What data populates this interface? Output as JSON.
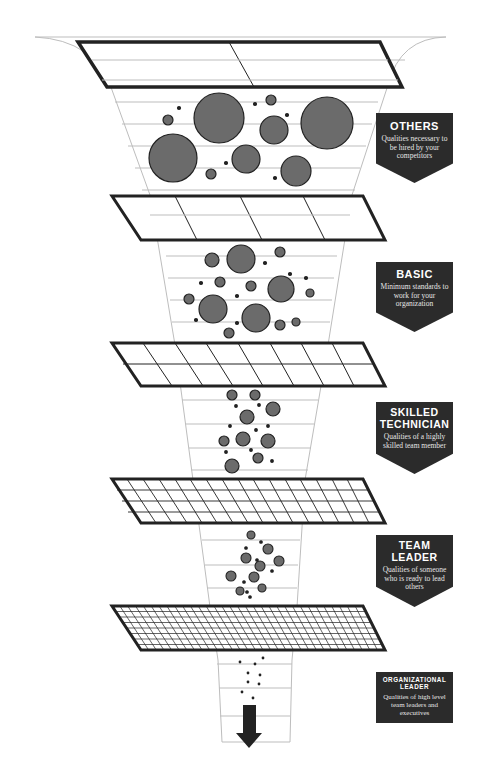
{
  "colors": {
    "box_fill": "#2b2b2b",
    "box_text": "#ffffff",
    "circle_fill": "#6b6b6b",
    "circle_stroke": "#222222",
    "screen_stroke": "#222222",
    "funnel_stroke": "#bdbdbd"
  },
  "levels": [
    {
      "title_lines": [
        "OTHERS"
      ],
      "description": "Qualities necessary to be hired by your competitors",
      "screen_cols": 2,
      "screen_rows": 1
    },
    {
      "title_lines": [
        "BASIC"
      ],
      "description": "Minimum standards to work for your organization",
      "screen_cols": 4,
      "screen_rows": 1
    },
    {
      "title_lines": [
        "SKILLED",
        "TECHNICIAN"
      ],
      "description": "Qualities of a highly skilled team member",
      "screen_cols": 8,
      "screen_rows": 2
    },
    {
      "title_lines": [
        "TEAM",
        "LEADER"
      ],
      "description": "Qualities of someone who is ready to lead others",
      "screen_cols": 16,
      "screen_rows": 4
    },
    {
      "title_lines": [
        "ORGANIZATIONAL",
        "LEADER"
      ],
      "description": "Qualities of high level team leaders and executives",
      "screen_cols": 32,
      "screen_rows": 8
    }
  ],
  "icons": {
    "output_arrow": "down-arrow-icon"
  }
}
